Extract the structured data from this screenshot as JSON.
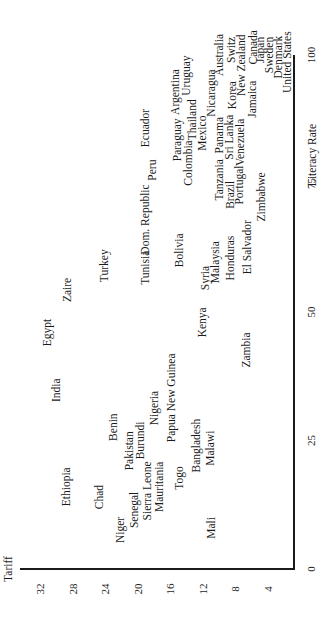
{
  "chart_data": {
    "type": "scatter",
    "title": "",
    "xlabel": "Literacy Rate",
    "ylabel": "Tariff",
    "xlim": [
      0,
      100
    ],
    "ylim": [
      0,
      34
    ],
    "x_ticks": [
      0,
      25,
      50,
      75,
      100
    ],
    "y_ticks": [
      4,
      8,
      12,
      16,
      20,
      24,
      28,
      32
    ],
    "grid": false,
    "legend": null,
    "orientation_note": "figure rotated 90 degrees counter-clockwise on page",
    "markers": "country names used as point labels",
    "points": [
      {
        "label": "Ethiopia",
        "x": 16,
        "y": 28.7
      },
      {
        "label": "Chad",
        "x": 14,
        "y": 24.6
      },
      {
        "label": "Niger",
        "x": 7.6,
        "y": 22
      },
      {
        "label": "Senegal",
        "x": 11.5,
        "y": 20.3
      },
      {
        "label": "Sierra Leone",
        "x": 15.2,
        "y": 18.7
      },
      {
        "label": "Mauritania",
        "x": 16,
        "y": 17.3
      },
      {
        "label": "Togo",
        "x": 17.7,
        "y": 14.8
      },
      {
        "label": "Mali",
        "x": 8,
        "y": 10.9
      },
      {
        "label": "Pakistan",
        "x": 23,
        "y": 21
      },
      {
        "label": "Benin",
        "x": 27.6,
        "y": 22.9
      },
      {
        "label": "Burundi",
        "x": 25,
        "y": 19.6
      },
      {
        "label": "Nigeria",
        "x": 31.3,
        "y": 17.9
      },
      {
        "label": "Papua New Guinea",
        "x": 33.3,
        "y": 15.8
      },
      {
        "label": "Bangladesh",
        "x": 24,
        "y": 12.7
      },
      {
        "label": "Malawi",
        "x": 23.5,
        "y": 11
      },
      {
        "label": "India",
        "x": 34.8,
        "y": 29.9
      },
      {
        "label": "Egypt",
        "x": 46,
        "y": 31
      },
      {
        "label": "Zaire",
        "x": 54.3,
        "y": 28.6
      },
      {
        "label": "Turkey",
        "x": 59,
        "y": 24
      },
      {
        "label": "Kenya",
        "x": 48,
        "y": 12
      },
      {
        "label": "Zambia",
        "x": 42.6,
        "y": 6.6
      },
      {
        "label": "Tunisia",
        "x": 58.6,
        "y": 19
      },
      {
        "label": "Dom. Republic",
        "x": 68,
        "y": 19
      },
      {
        "label": "Bolivia",
        "x": 62,
        "y": 14.8
      },
      {
        "label": "Syria",
        "x": 56.6,
        "y": 11.6
      },
      {
        "label": "Malaysia",
        "x": 59.7,
        "y": 10.4
      },
      {
        "label": "Honduras",
        "x": 60.5,
        "y": 8.6
      },
      {
        "label": "El Salvador",
        "x": 62.6,
        "y": 6.5
      },
      {
        "label": "Zimbabwe",
        "x": 72.4,
        "y": 4.8
      },
      {
        "label": "Peru",
        "x": 77.6,
        "y": 18.1
      },
      {
        "label": "Ecuador",
        "x": 85.8,
        "y": 19
      },
      {
        "label": "Paraguay",
        "x": 83.5,
        "y": 15
      },
      {
        "label": "Colombia",
        "x": 79,
        "y": 13.7
      },
      {
        "label": "Thailand",
        "x": 87.4,
        "y": 13.2
      },
      {
        "label": "Mexico",
        "x": 84.8,
        "y": 12
      },
      {
        "label": "Argentina",
        "x": 92.8,
        "y": 15.3
      },
      {
        "label": "Uruguay",
        "x": 96,
        "y": 14
      },
      {
        "label": "Tanzania",
        "x": 75.7,
        "y": 9.9
      },
      {
        "label": "Brazil",
        "x": 72.8,
        "y": 8.6
      },
      {
        "label": "Portugal",
        "x": 74.7,
        "y": 7.5
      },
      {
        "label": "Panama",
        "x": 84.4,
        "y": 9.9
      },
      {
        "label": "Sri Lanka",
        "x": 84,
        "y": 8.7
      },
      {
        "label": "Venezuela",
        "x": 83,
        "y": 7.3
      },
      {
        "label": "Nicaragua",
        "x": 92.6,
        "y": 10.9
      },
      {
        "label": "Korea",
        "x": 92.2,
        "y": 8.3
      },
      {
        "label": "Jamaica",
        "x": 91.4,
        "y": 5.9
      },
      {
        "label": "Australia",
        "x": 100,
        "y": 9.9
      },
      {
        "label": "Switz",
        "x": 101,
        "y": 8.4
      },
      {
        "label": "New Zealand",
        "x": 98,
        "y": 7.2
      },
      {
        "label": "Canada",
        "x": 101.5,
        "y": 5.7
      },
      {
        "label": "Japan",
        "x": 101,
        "y": 4.9
      },
      {
        "label": "Sweden",
        "x": 100,
        "y": 3.8
      },
      {
        "label": "Denmark",
        "x": 99.6,
        "y": 2.7
      },
      {
        "label": "United States",
        "x": 98.6,
        "y": 1.6
      }
    ]
  },
  "axes": {
    "x_title": "Literacy Rate",
    "y_title": "Tariff",
    "x_tick_labels": [
      "0",
      "25",
      "50",
      "75",
      "100"
    ],
    "y_tick_labels": [
      "4",
      "8",
      "12",
      "16",
      "20",
      "24",
      "28",
      "32"
    ]
  }
}
